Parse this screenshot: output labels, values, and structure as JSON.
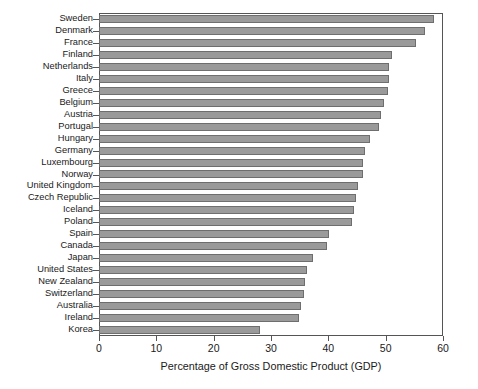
{
  "chart_data": {
    "type": "bar",
    "orientation": "horizontal",
    "title": "",
    "xlabel": "Percentage of Gross Domestic Product (GDP)",
    "ylabel": "",
    "xlim": [
      0,
      60
    ],
    "xticks": [
      0,
      10,
      20,
      30,
      40,
      50,
      60
    ],
    "grid": false,
    "legend": null,
    "bar_color": "#9a9a9a",
    "bar_edge_color": "#6e6e6e",
    "categories": [
      "Sweden",
      "Denmark",
      "France",
      "Finland",
      "Netherlands",
      "Italy",
      "Greece",
      "Belgium",
      "Austria",
      "Portugal",
      "Hungary",
      "Germany",
      "Luxembourg",
      "Norway",
      "United Kingdom",
      "Czech Republic",
      "Iceland",
      "Poland",
      "Spain",
      "Canada",
      "Japan",
      "United States",
      "New Zealand",
      "Switzerland",
      "Australia",
      "Ireland",
      "Korea"
    ],
    "values": [
      58.4,
      56.8,
      55.3,
      51.1,
      50.6,
      50.6,
      50.4,
      49.7,
      49.2,
      48.9,
      47.3,
      46.4,
      46.1,
      46.0,
      45.1,
      44.8,
      44.5,
      44.1,
      40.2,
      39.7,
      37.4,
      36.3,
      35.9,
      35.7,
      35.2,
      34.8,
      28.0
    ]
  }
}
